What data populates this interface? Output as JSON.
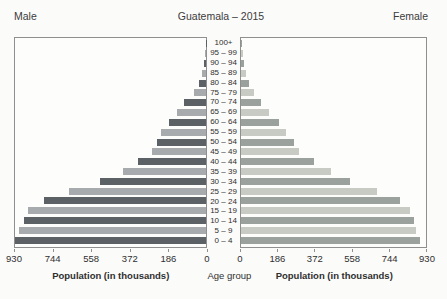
{
  "title": "Guatemala – 2015",
  "left_header": "Male",
  "right_header": "Female",
  "axes": {
    "left_ticks": [
      "930",
      "744",
      "558",
      "372",
      "186",
      "0"
    ],
    "right_ticks": [
      "0",
      "186",
      "372",
      "558",
      "744",
      "930"
    ],
    "left_axis_title": "Population (in thousands)",
    "right_axis_title": "Population (in thousands)",
    "center_axis_title": "Age group"
  },
  "colors": {
    "male_dark": "#5c6166",
    "male_light": "#a7abae",
    "female_dark": "#9ba19c",
    "female_light": "#c7cbc4",
    "plot_border": "#8f8f8f",
    "background": "#fbfbfa"
  },
  "chart_data": {
    "type": "bar",
    "subtype": "population-pyramid",
    "title": "Guatemala – 2015",
    "xlabel": "Population (in thousands)",
    "ylabel": "Age group",
    "units": "thousands",
    "xlim": [
      0,
      930
    ],
    "grid": false,
    "categories": [
      "100+",
      "95 – 99",
      "90 – 94",
      "85 – 89",
      "80 – 84",
      "75 – 79",
      "70 – 74",
      "65 – 69",
      "60 – 64",
      "55 – 59",
      "50 – 54",
      "45 – 49",
      "40 – 44",
      "35 – 39",
      "30 – 34",
      "25 – 29",
      "20 – 24",
      "15 – 19",
      "10 – 14",
      "5 – 9",
      "0 – 4"
    ],
    "series": [
      {
        "name": "Male",
        "side": "left",
        "values": [
          2,
          5,
          10,
          20,
          35,
          60,
          105,
          140,
          180,
          220,
          240,
          265,
          330,
          405,
          515,
          665,
          790,
          865,
          885,
          910,
          930
        ]
      },
      {
        "name": "Female",
        "side": "right",
        "values": [
          3,
          8,
          13,
          23,
          41,
          66,
          102,
          142,
          190,
          225,
          265,
          290,
          365,
          450,
          550,
          685,
          800,
          850,
          870,
          880,
          900
        ]
      }
    ]
  }
}
